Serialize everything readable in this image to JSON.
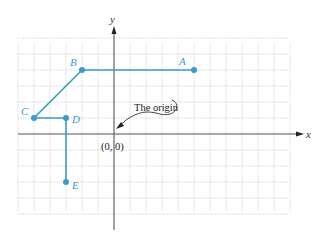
{
  "diagram": {
    "title": "",
    "grid": {
      "unit_px": 16,
      "origin_px": [
        114,
        134
      ],
      "x_range": [
        -6,
        11
      ],
      "y_range": [
        -5,
        6
      ]
    },
    "axes": {
      "x_label": "x",
      "y_label": "y"
    },
    "origin_label": "(0, 0)",
    "annotation": "The origin",
    "points": [
      {
        "name": "A",
        "x": 5,
        "y": 4
      },
      {
        "name": "B",
        "x": -2,
        "y": 4
      },
      {
        "name": "C",
        "x": -5,
        "y": 1
      },
      {
        "name": "D",
        "x": -3,
        "y": 1
      },
      {
        "name": "E",
        "x": -3,
        "y": -3
      }
    ],
    "path_order": [
      "A",
      "B",
      "C",
      "D",
      "E"
    ],
    "colors": {
      "path": "#3d9ad1",
      "axis": "#555555",
      "grid": "#c8c8c8"
    }
  }
}
